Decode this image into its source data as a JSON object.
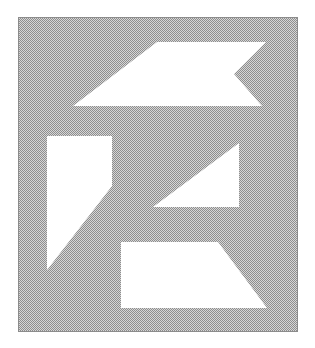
{
  "canvas": {
    "width": 315,
    "height": 348,
    "background_color": "#ffffff"
  },
  "panel": {
    "x": 18,
    "y": 17,
    "width": 280,
    "height": 315,
    "fill": "checkerboard-gray",
    "light_color": "#d6d6d6",
    "dark_color": "#8e8e8e",
    "border_color": "#8c8c8c"
  },
  "shapes": [
    {
      "name": "notched-parallelogram",
      "fill": "#ffffff",
      "points": "157,42 266,42 234,74 262,106 73,106"
    },
    {
      "name": "left-truncated-triangle",
      "fill": "#ffffff",
      "points": "47,136 112,136 112,186 47,270"
    },
    {
      "name": "right-triangle",
      "fill": "#ffffff",
      "points": "239,143 239,207 153,207"
    },
    {
      "name": "bottom-trapezoid",
      "fill": "#ffffff",
      "points": "121,242 218,242 267,308 121,308"
    }
  ]
}
